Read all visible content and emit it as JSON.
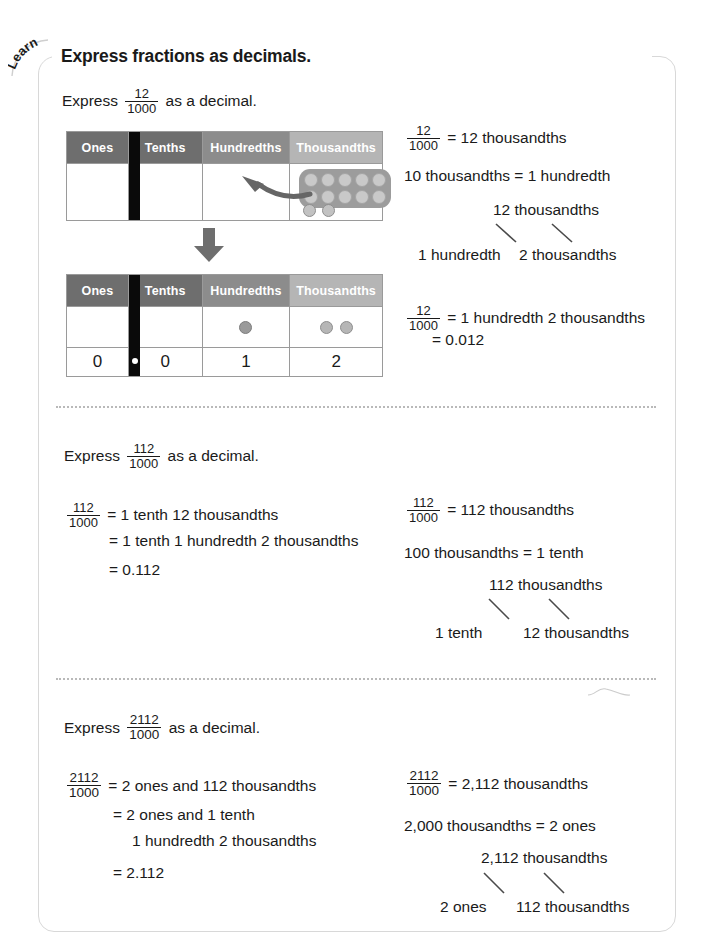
{
  "page": {
    "badge_label": "Learn",
    "heading": "Express fractions as decimals."
  },
  "colors": {
    "header_ones": "#6e6e6e",
    "header_tenths": "#6e6e6e",
    "header_hundredths": "#8c8c8c",
    "header_thousandths": "#b5b5b5",
    "separator": "#0a0a0a",
    "counter": "#b6b6b6",
    "border": "#9a9a9a",
    "frame": "#d8d8d8"
  },
  "table_headers": [
    "Ones",
    "Tenths",
    "Hundredths",
    "Thousandths"
  ],
  "section1": {
    "prompt_prefix": "Express",
    "prompt_fraction": {
      "numerator": "12",
      "denominator": "1000"
    },
    "prompt_suffix": "as a decimal.",
    "table1": {
      "counters": {
        "thousandths_group": 10,
        "thousandths_loose": 2
      },
      "arrow": "regroup-arrow"
    },
    "table2": {
      "counters": {
        "hundredths": 1,
        "thousandths": 2
      },
      "digits": [
        "0",
        "0",
        "1",
        "2"
      ],
      "decimal_point": "."
    },
    "right": {
      "line1_fraction": {
        "numerator": "12",
        "denominator": "1000"
      },
      "line1_text": "= 12 thousandths",
      "line2": "10 thousandths = 1 hundredth",
      "branch_top": "12 thousandths",
      "branch_left": "1 hundredth",
      "branch_right": "2 thousandths",
      "line3_fraction": {
        "numerator": "12",
        "denominator": "1000"
      },
      "line3_text": "= 1 hundredth 2 thousandths",
      "line4": "= 0.012"
    }
  },
  "section2": {
    "prompt_prefix": "Express",
    "prompt_fraction": {
      "numerator": "112",
      "denominator": "1000"
    },
    "prompt_suffix": "as a decimal.",
    "left": {
      "fraction": {
        "numerator": "112",
        "denominator": "1000"
      },
      "line1": "= 1 tenth 12 thousandths",
      "line2": "= 1 tenth 1 hundredth 2 thousandths",
      "line3": "= 0.112"
    },
    "right": {
      "fraction": {
        "numerator": "112",
        "denominator": "1000"
      },
      "line1": "= 112 thousandths",
      "line2": "100 thousandths = 1 tenth",
      "branch_top": "112 thousandths",
      "branch_left": "1 tenth",
      "branch_right": "12 thousandths"
    }
  },
  "section3": {
    "prompt_prefix": "Express",
    "prompt_fraction": {
      "numerator": "2112",
      "denominator": "1000"
    },
    "prompt_suffix": "as a decimal.",
    "left": {
      "fraction": {
        "numerator": "2112",
        "denominator": "1000"
      },
      "line1": "= 2 ones and 112 thousandths",
      "line2": "= 2 ones and 1 tenth",
      "line3": "1 hundredth 2 thousandths",
      "line4": "= 2.112"
    },
    "right": {
      "fraction": {
        "numerator": "2112",
        "denominator": "1000"
      },
      "line1": "= 2,112 thousandths",
      "line2": "2,000 thousandths = 2 ones",
      "branch_top": "2,112 thousandths",
      "branch_left": "2 ones",
      "branch_right": "112 thousandths"
    }
  }
}
